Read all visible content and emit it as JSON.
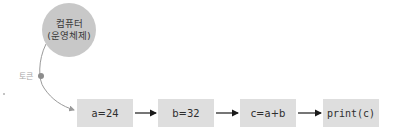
{
  "diagram": {
    "source_node": {
      "line1": "컴퓨터",
      "line2": "(운영체제)",
      "fill_color": "#c8c8c8"
    },
    "token": {
      "label": "토큰",
      "dot_color": "#8c8c8c"
    },
    "steps": [
      {
        "label": "a=24"
      },
      {
        "label": "b=32"
      },
      {
        "label": "c=a+b"
      },
      {
        "label": "print(c)"
      }
    ],
    "box_color": "#dedede",
    "arrow_color": "#1a1a1a",
    "curve_color": "#9a9a9a"
  }
}
